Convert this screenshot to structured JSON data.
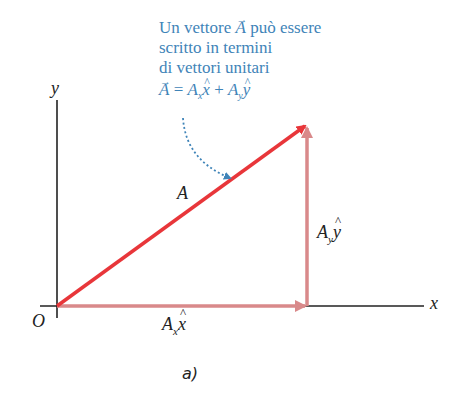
{
  "caption": {
    "line1_pre": "Un vettore ",
    "line1_vec": "A",
    "line1_post": " può essere",
    "line2": "scritto in termini",
    "line3": "di vettori unitari",
    "equation": {
      "lhs": "A",
      "eq": " = ",
      "term1_coef": "A",
      "term1_sub": "x",
      "term1_unit": "x",
      "plus": " + ",
      "term2_coef": "A",
      "term2_sub": "y",
      "term2_unit": "y"
    }
  },
  "axes": {
    "x_label": "x",
    "y_label": "y",
    "origin_label": "O"
  },
  "vectors": {
    "A_label": "A",
    "Ax": {
      "coef": "A",
      "sub": "x",
      "unit": "x"
    },
    "Ay": {
      "coef": "A",
      "sub": "y",
      "unit": "y"
    }
  },
  "figure_label": "a)",
  "colors": {
    "vector_A": "#e8363a",
    "components": "#d9898a",
    "axes": "#222222",
    "annotation": "#3f84b8"
  }
}
